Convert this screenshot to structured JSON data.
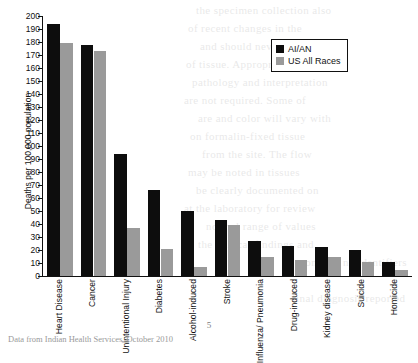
{
  "chart_data": {
    "type": "bar",
    "title": "",
    "xlabel": "",
    "ylabel": "Deaths per 100,000 population",
    "ylim": [
      0,
      200
    ],
    "ytick_step": 10,
    "yticks": [
      0,
      10,
      20,
      30,
      40,
      50,
      60,
      70,
      80,
      90,
      100,
      110,
      120,
      130,
      140,
      150,
      160,
      170,
      180,
      190,
      200
    ],
    "grid": false,
    "legend_position": "top-right",
    "categories": [
      "Heart Disease",
      "Cancer",
      "Unintentional Injury",
      "Diabetes",
      "Alcohol-induced",
      "Stroke",
      "Influenza/ Pneumonia",
      "Drug-induced",
      "Kidney disease",
      "Suicide",
      "Homicide"
    ],
    "series": [
      {
        "name": "AI/AN",
        "color": "#0d0d0d",
        "values": [
          194,
          178,
          94,
          66,
          50,
          43,
          27,
          23,
          22,
          20,
          11
        ]
      },
      {
        "name": "US All Races",
        "color": "#9a9a9a",
        "values": [
          179,
          173,
          37,
          21,
          7,
          39,
          15,
          12,
          15,
          11,
          5
        ]
      }
    ]
  },
  "legend": {
    "entries": [
      {
        "label": "AI/AN"
      },
      {
        "label": "US All Races"
      }
    ]
  },
  "footer": {
    "page_number": "5",
    "source_note": "Data from Indian Health Services, October 2010"
  },
  "bleed_text": [
    "the specimen collection also",
    "of recent changes in the",
    "and should never be used",
    "of tissue. Appropriate",
    "pathology and interpretation",
    "are not required. Some of",
    "are and color will vary with",
    "on formalin-fixed tissue",
    "from the site. The flow",
    "may be noted in tissues",
    "be clearly documented on",
    "at the laboratory for review",
    "normal range of values",
    "the clinical findings and",
    "contains no identifiers",
    "final diagnosis reported"
  ]
}
